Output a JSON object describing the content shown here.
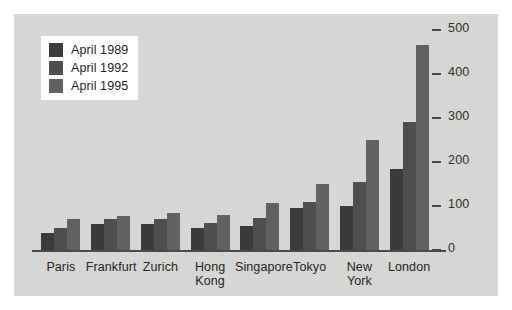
{
  "chart_data": {
    "type": "bar",
    "title": "",
    "xlabel": "",
    "ylabel": "",
    "ylim": [
      0,
      500
    ],
    "yticks": [
      0,
      100,
      200,
      300,
      400,
      500
    ],
    "ytick_labels": [
      "0",
      "100",
      "200",
      "300",
      "400",
      "500"
    ],
    "grid": false,
    "legend_position": "top-left",
    "categories": [
      "Paris",
      "Frankfurt",
      "Zurich",
      "Hong Kong",
      "Singapore",
      "Tokyo",
      "New York",
      "London"
    ],
    "series": [
      {
        "name": "April 1989",
        "color": "#3b3b3b",
        "values": [
          38,
          59,
          60,
          50,
          55,
          95,
          100,
          185
        ]
      },
      {
        "name": "April 1992",
        "color": "#4e4e4e",
        "values": [
          50,
          70,
          70,
          62,
          72,
          110,
          155,
          290
        ]
      },
      {
        "name": "April 1995",
        "color": "#616161",
        "values": [
          70,
          77,
          85,
          80,
          107,
          150,
          250,
          465
        ]
      }
    ]
  },
  "legend": {
    "items": [
      {
        "label": "April 1989",
        "color": "#3b3b3b"
      },
      {
        "label": "April 1992",
        "color": "#4e4e4e"
      },
      {
        "label": "April 1995",
        "color": "#616161"
      }
    ]
  },
  "colors": {
    "panel_background": "#d6d6d4",
    "page_background": "#ffffff",
    "axis": "#4a4a4a",
    "text": "#242424",
    "legend_background": "#ffffff"
  }
}
